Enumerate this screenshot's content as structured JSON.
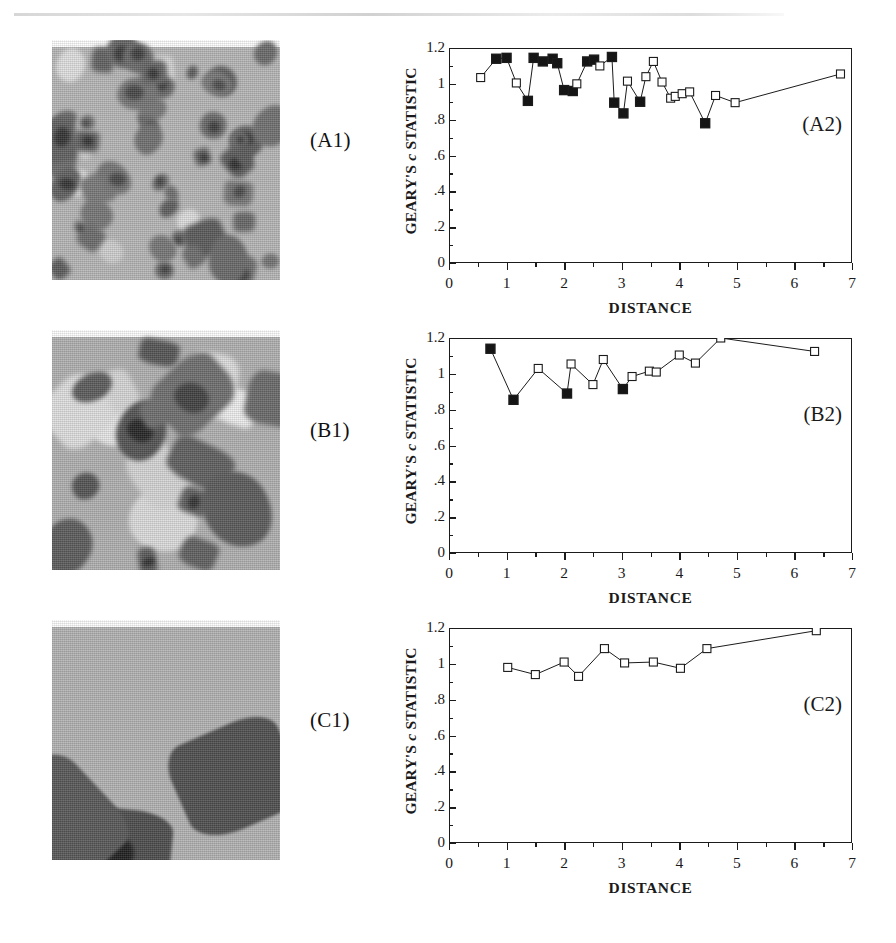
{
  "figure": {
    "panels": [
      {
        "id": "A",
        "image_tag": "(A1)",
        "chart_tag": "(A2)",
        "image_description": "grainy grayscale map with many small dark patches"
      },
      {
        "id": "B",
        "image_tag": "(B1)",
        "chart_tag": "(B2)",
        "image_description": "grainy grayscale map with fewer medium dark and light patches"
      },
      {
        "id": "C",
        "image_tag": "(C1)",
        "chart_tag": "(C2)",
        "image_description": "grainy grayscale map with a few large polygonal dark patches"
      }
    ]
  },
  "axes": {
    "xlabel": "DISTANCE",
    "ylabel_prefix": "GEARY'S ",
    "ylabel_italic": "c",
    "ylabel_suffix": " STATISTIC",
    "x_ticks": [
      "0",
      "1",
      "2",
      "3",
      "4",
      "5",
      "6",
      "7"
    ],
    "y_ticks": [
      "0",
      ".2",
      ".4",
      ".6",
      ".8",
      "1",
      "1.2"
    ]
  },
  "chart_data": [
    {
      "type": "line",
      "title": "(A2)",
      "xlabel": "DISTANCE",
      "ylabel": "GEARY'S c STATISTIC",
      "xlim": [
        0,
        7
      ],
      "ylim": [
        0,
        1.2
      ],
      "grid": false,
      "legend": "none",
      "marker_legend": {
        "filled": "significant",
        "open": "not significant"
      },
      "x": [
        0.55,
        0.82,
        1.0,
        1.17,
        1.37,
        1.47,
        1.63,
        1.8,
        1.88,
        2.0,
        2.15,
        2.22,
        2.4,
        2.52,
        2.62,
        2.83,
        2.87,
        3.03,
        3.1,
        3.32,
        3.42,
        3.55,
        3.7,
        3.85,
        3.93,
        4.05,
        4.18,
        4.45,
        4.63,
        4.97,
        6.8
      ],
      "y": [
        1.035,
        1.14,
        1.145,
        1.005,
        0.905,
        1.145,
        1.125,
        1.14,
        1.115,
        0.965,
        0.96,
        1.0,
        1.125,
        1.135,
        1.1,
        1.15,
        0.895,
        0.835,
        1.015,
        0.9,
        1.04,
        1.125,
        1.01,
        0.92,
        0.93,
        0.945,
        0.955,
        0.78,
        0.935,
        0.895,
        1.055
      ],
      "filled": [
        false,
        true,
        true,
        false,
        true,
        true,
        true,
        true,
        true,
        true,
        true,
        false,
        true,
        true,
        false,
        true,
        true,
        true,
        false,
        true,
        false,
        false,
        false,
        false,
        false,
        false,
        false,
        true,
        false,
        false,
        false
      ]
    },
    {
      "type": "line",
      "title": "(B2)",
      "xlabel": "DISTANCE",
      "ylabel": "GEARY'S c STATISTIC",
      "xlim": [
        0,
        7
      ],
      "ylim": [
        0,
        1.2
      ],
      "grid": false,
      "legend": "none",
      "marker_legend": {
        "filled": "significant",
        "open": "not significant"
      },
      "x": [
        0.72,
        1.12,
        1.55,
        2.05,
        2.12,
        2.5,
        2.68,
        3.02,
        3.18,
        3.48,
        3.6,
        4.0,
        4.28,
        4.72,
        6.35
      ],
      "y": [
        1.14,
        0.855,
        1.03,
        0.89,
        1.055,
        0.94,
        1.08,
        0.915,
        0.985,
        1.015,
        1.01,
        1.105,
        1.06,
        1.2,
        1.125
      ],
      "filled": [
        true,
        true,
        false,
        true,
        false,
        false,
        false,
        true,
        false,
        false,
        false,
        false,
        false,
        false,
        false
      ]
    },
    {
      "type": "line",
      "title": "(C2)",
      "xlabel": "DISTANCE",
      "ylabel": "GEARY'S c STATISTIC",
      "xlim": [
        0,
        7
      ],
      "ylim": [
        0,
        1.2
      ],
      "grid": false,
      "legend": "none",
      "marker_legend": {
        "filled": "significant",
        "open": "not significant"
      },
      "x": [
        1.02,
        1.5,
        2.0,
        2.25,
        2.7,
        3.05,
        3.55,
        4.02,
        4.48,
        6.38
      ],
      "y": [
        0.98,
        0.94,
        1.01,
        0.93,
        1.085,
        1.005,
        1.01,
        0.975,
        1.085,
        1.185
      ],
      "filled": [
        false,
        false,
        false,
        false,
        false,
        false,
        false,
        false,
        false,
        false
      ]
    }
  ]
}
